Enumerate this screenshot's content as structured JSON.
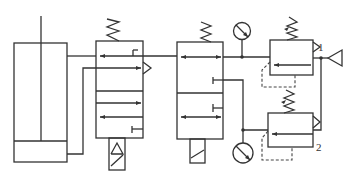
{
  "diagram": {
    "type": "pneumatic-circuit",
    "line_color": "#333333",
    "background": "#ffffff",
    "components": [
      {
        "id": "cylinder",
        "kind": "single-rod cylinder"
      },
      {
        "id": "valve-1",
        "kind": "solenoid 3-position directional valve, spring return"
      },
      {
        "id": "valve-2",
        "kind": "solenoid 2-position directional valve, spring return"
      },
      {
        "id": "gauge-1",
        "kind": "pressure gauge"
      },
      {
        "id": "gauge-2",
        "kind": "pressure gauge"
      },
      {
        "id": "regulator-1",
        "kind": "pressure regulating valve",
        "label": "1"
      },
      {
        "id": "regulator-2",
        "kind": "pressure regulating valve",
        "label": "2"
      },
      {
        "id": "air-source",
        "kind": "pneumatic pressure source"
      }
    ],
    "labels": {
      "regulator_1": "1",
      "regulator_2": "2"
    }
  }
}
